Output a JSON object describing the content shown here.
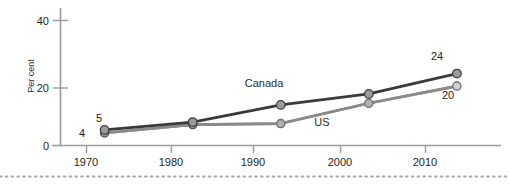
{
  "chart_data": {
    "type": "line",
    "title": "",
    "xlabel": "",
    "ylabel": "Per cent",
    "xlim": [
      1966,
      2016
    ],
    "ylim": [
      0,
      44
    ],
    "grid": false,
    "legend_position": "inline-annotation",
    "x_ticks": [
      "1970",
      "1980",
      "1990",
      "2000",
      "2010"
    ],
    "x_tick_values": [
      1970,
      1980,
      1990,
      2000,
      2010
    ],
    "y_ticks": [
      "0",
      "20",
      "40"
    ],
    "y_tick_values": [
      0,
      20,
      40
    ],
    "x": [
      1971,
      1981,
      1991,
      2001,
      2011
    ],
    "series": [
      {
        "name": "Canada",
        "color": "#3a3a3a",
        "marker_fill": "#9b9b9b",
        "values": [
          5,
          7.5,
          13,
          16.5,
          23
        ],
        "start_label": "5",
        "end_label": "24"
      },
      {
        "name": "US",
        "color": "#8a8a8a",
        "marker_fill": "#b5b5b5",
        "values": [
          4,
          6.7,
          7,
          13.5,
          19
        ],
        "start_label": "4",
        "end_label": "20"
      }
    ],
    "annotations": [
      {
        "text": "Canada",
        "x": 1991,
        "y": 19.5
      },
      {
        "text": "US",
        "x": 2000.5,
        "y": 7.5
      },
      {
        "text": "4",
        "x": 1969.5,
        "y": 3.2
      },
      {
        "text": "5",
        "x": 1971.2,
        "y": 8.6
      },
      {
        "text": "24",
        "x": 2010.3,
        "y": 27.2
      },
      {
        "text": "20",
        "x": 2012.4,
        "y": 15.5
      }
    ]
  },
  "axis": {
    "ylabel": "Per cent",
    "y_tick_0": "0",
    "y_tick_20": "20",
    "y_tick_40": "40",
    "x_tick_1970": "1970",
    "x_tick_1980": "1980",
    "x_tick_1990": "1990",
    "x_tick_2000": "2000",
    "x_tick_2010": "2010"
  },
  "labels": {
    "canada": "Canada",
    "us": "US",
    "canada_start": "5",
    "canada_end": "24",
    "us_start": "4",
    "us_end": "20"
  },
  "colors": {
    "canada_line": "#3a3a3a",
    "us_line": "#8a8a8a",
    "marker_fill": "#9b9b9b",
    "marker_stroke": "#4a4a4a",
    "axis": "#9a9a9a",
    "text": "#1d1d1d",
    "footer_dots": "#a6a6a6"
  }
}
